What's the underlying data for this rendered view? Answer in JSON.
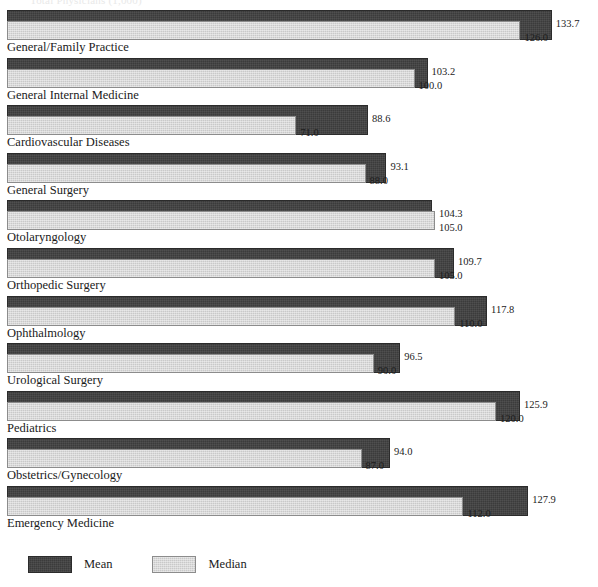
{
  "clipped_header_text": "Total Physicians (1,000)",
  "legend": {
    "position": "bottom-left",
    "entries": [
      {
        "name": "mean-legend",
        "label": "Mean",
        "color": "#3b3b3b"
      },
      {
        "name": "median-legend",
        "label": "Median",
        "color": "#c9c9c9"
      }
    ]
  },
  "chart_data": {
    "type": "bar",
    "orientation": "horizontal",
    "title": "",
    "subtitle": "",
    "xlabel": "",
    "ylabel": "",
    "grid": false,
    "legend_position": "bottom-left",
    "xlim": [
      0,
      140
    ],
    "categories": [
      "General/Family Practice",
      "General Internal Medicine",
      "Cardiovascular Diseases",
      "General Surgery",
      "Otolaryngology",
      "Orthopedic Surgery",
      "Ophthalmology",
      "Urological Surgery",
      "Pediatrics",
      "Obstetrics/Gynecology",
      "Emergency Medicine"
    ],
    "series": [
      {
        "name": "Mean",
        "color": "#3b3b3b",
        "values": [
          133.7,
          103.2,
          88.6,
          93.1,
          104.3,
          109.7,
          117.8,
          96.5,
          125.9,
          94.0,
          127.9
        ],
        "labels": [
          "133.7",
          "103.2",
          "88.6",
          "93.1",
          "104.3",
          "109.7",
          "117.8",
          "96.5",
          "125.9",
          "94.0",
          "127.9"
        ]
      },
      {
        "name": "Median",
        "color": "#c9c9c9",
        "values": [
          126.0,
          100.0,
          71.0,
          88.0,
          105.0,
          105.0,
          110.0,
          90.0,
          120.0,
          87.0,
          112.0
        ],
        "labels": [
          "126.0",
          "100.0",
          "71.0",
          "88.0",
          "105.0",
          "105.0",
          "110.0",
          "90.0",
          "120.0",
          "87.0",
          "112.0"
        ]
      }
    ]
  }
}
